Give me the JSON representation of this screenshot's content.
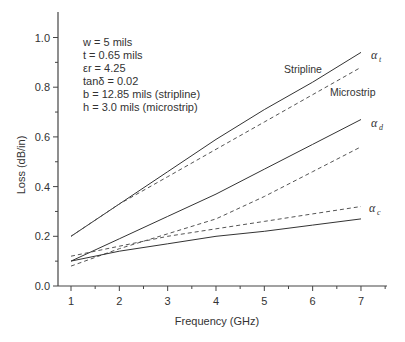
{
  "chart_data": {
    "type": "line",
    "title": "",
    "xlabel": "Frequency (GHz)",
    "ylabel": "Loss (dB/in)",
    "xlim": [
      0.75,
      7.55
    ],
    "ylim": [
      0.0,
      1.1
    ],
    "xticks": [
      1,
      2,
      3,
      4,
      5,
      6,
      7
    ],
    "yticks": [
      0.0,
      0.2,
      0.4,
      0.6,
      0.8,
      1.0
    ],
    "ytick_labels": [
      "0.0",
      "0.2",
      "0.4",
      "0.6",
      "0.8",
      "1.0"
    ],
    "grid": false,
    "x": [
      1,
      2,
      3,
      4,
      5,
      6,
      7
    ],
    "series": [
      {
        "name": "Stripline alpha_t",
        "style": "solid",
        "values": [
          0.2,
          0.33,
          0.46,
          0.59,
          0.71,
          0.82,
          0.94
        ]
      },
      {
        "name": "Microstrip alpha_t",
        "style": "dashed",
        "values": [
          0.2,
          0.33,
          0.44,
          0.55,
          0.66,
          0.77,
          0.88
        ]
      },
      {
        "name": "Stripline alpha_d",
        "style": "solid",
        "values": [
          0.1,
          0.19,
          0.28,
          0.37,
          0.47,
          0.57,
          0.67
        ]
      },
      {
        "name": "Microstrip alpha_d",
        "style": "dashed",
        "values": [
          0.08,
          0.15,
          0.21,
          0.27,
          0.36,
          0.46,
          0.56
        ]
      },
      {
        "name": "Microstrip alpha_c",
        "style": "dashed",
        "values": [
          0.12,
          0.16,
          0.2,
          0.23,
          0.26,
          0.29,
          0.32
        ]
      },
      {
        "name": "Stripline alpha_c",
        "style": "solid",
        "values": [
          0.1,
          0.14,
          0.17,
          0.2,
          0.22,
          0.245,
          0.27
        ]
      }
    ],
    "annotations": {
      "params": [
        "w = 5 mils",
        "t = 0.65 mils",
        "εr = 4.25",
        "tanδ = 0.02",
        "b = 12.85 mils (stripline)",
        "h = 3.0 mils (microstrip)"
      ],
      "labels": {
        "stripline": "Stripline",
        "microstrip": "Microstrip",
        "alpha_t": "α",
        "alpha_t_sub": "t",
        "alpha_d": "α",
        "alpha_d_sub": "d",
        "alpha_c": "α",
        "alpha_c_sub": "c"
      }
    }
  }
}
